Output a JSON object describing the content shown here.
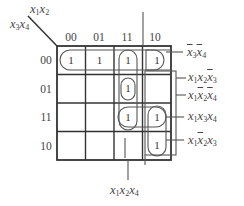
{
  "kmap": {
    "corner_top_var": "x1x2",
    "corner_left_var": "x3x4",
    "column_headers": [
      "00",
      "01",
      "11",
      "10"
    ],
    "row_headers": [
      "00",
      "01",
      "11",
      "10"
    ],
    "cells": [
      [
        "1",
        "1",
        "1",
        "1"
      ],
      [
        "",
        "",
        "1",
        ""
      ],
      [
        "",
        "",
        "1",
        "1"
      ],
      [
        "",
        "",
        "",
        "1"
      ]
    ]
  },
  "implicants": [
    {
      "label": "x̄3x̄4",
      "cells": "row 00, all columns"
    },
    {
      "label": "x1x2x̄3",
      "cells": "rows 00-01, col 11"
    },
    {
      "label": "x1x̄2x̄4",
      "cells": "rows 00 and 10, col 10"
    },
    {
      "label": "x1x3x4",
      "cells": "row 11, cols 11-10"
    },
    {
      "label": "x1x̄2x3",
      "cells": "rows 11-10, col 10"
    },
    {
      "label": "x1x2x4",
      "cells": "rows 01-11, col 11"
    }
  ],
  "colors": {
    "grid": "#333333",
    "loop": "#555555",
    "text": "#444444",
    "background": "#ffffff"
  }
}
